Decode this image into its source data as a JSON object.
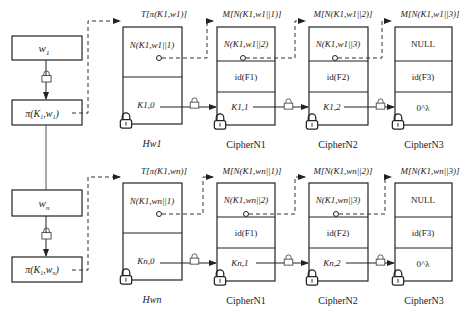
{
  "rows": [
    {
      "keyword": "w1",
      "keyword_label": {
        "base": "w",
        "sub": "1"
      },
      "prf_label": {
        "text": "π(K",
        "sub1": "1",
        "mid": ",w",
        "sub2": "1",
        "end": ")"
      },
      "header": {
        "top_label": "T[π(K1,w1)]",
        "cell_top": "N(K1,w1||1)",
        "cell_bottom": "K1,0",
        "caption": "Hw1"
      },
      "ciphers": [
        {
          "top_label": "M[N(K1,w1||1)]",
          "cell1": "N(K1,w1||2)",
          "cell2": "id(F1)",
          "cell3": "K1,1",
          "caption": "CipherN1"
        },
        {
          "top_label": "M[N(K1,w1||2)]",
          "cell1": "N(K1,w1||3)",
          "cell2": "id(F2)",
          "cell3": "K1,2",
          "caption": "CipherN2"
        },
        {
          "top_label": "M[N(K1,w1||3)]",
          "cell1": "NULL",
          "cell2": "id(F3)",
          "cell3": "0^λ",
          "caption": "CipherN3"
        }
      ]
    },
    {
      "keyword": "wn",
      "keyword_label": {
        "base": "w",
        "sub": "n"
      },
      "prf_label": {
        "text": "π(K",
        "sub1": "1",
        "mid": ",w",
        "sub2": "n",
        "end": ")"
      },
      "header": {
        "top_label": "T[π(K1,wn)]",
        "cell_top": "N(K1,wn||1)",
        "cell_bottom": "Kn,0",
        "caption": "Hwn"
      },
      "ciphers": [
        {
          "top_label": "M[N(K1,wn||1)]",
          "cell1": "N(K1,wn||2)",
          "cell2": "id(F1)",
          "cell3": "Kn,1",
          "caption": "CipherN1"
        },
        {
          "top_label": "M[N(K1,wn||2)]",
          "cell1": "N(K1,wn||3)",
          "cell2": "id(F2)",
          "cell3": "Kn,2",
          "caption": "CipherN2"
        },
        {
          "top_label": "M[N(K1,wn||3)]",
          "cell1": "NULL",
          "cell2": "id(F3)",
          "cell3": "0^λ",
          "caption": "CipherN3"
        }
      ]
    }
  ],
  "icons": {
    "lock": "padlock-icon",
    "small_lock_on_arrow": "encrypt-lock-icon"
  },
  "colors": {
    "stroke": "#222222",
    "dashed": "#333333",
    "background": "#ffffff"
  }
}
